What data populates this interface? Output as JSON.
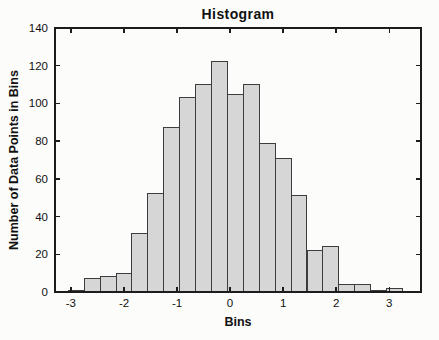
{
  "figure_title": "Histogram",
  "chart_data": {
    "type": "bar",
    "subtype": "histogram",
    "title": "Histogram",
    "xlabel": "Bins",
    "ylabel": "Number of Data Points in Bins",
    "bin_edges": [
      -3.05,
      -2.75,
      -2.45,
      -2.15,
      -1.85,
      -1.55,
      -1.25,
      -0.95,
      -0.65,
      -0.35,
      -0.05,
      0.25,
      0.55,
      0.85,
      1.15,
      1.45,
      1.75,
      2.05,
      2.35,
      2.65,
      2.95,
      3.25
    ],
    "values": [
      1,
      7,
      8,
      10,
      31,
      52,
      87,
      103,
      110,
      122,
      105,
      110,
      79,
      71,
      51,
      22,
      24,
      4,
      4,
      1,
      2
    ],
    "xlim": [
      -3.3,
      3.6
    ],
    "ylim": [
      0,
      140
    ],
    "x_ticks": [
      -3,
      -2,
      -1,
      0,
      1,
      2,
      3
    ],
    "y_ticks": [
      0,
      20,
      40,
      60,
      80,
      100,
      120,
      140
    ],
    "grid": false,
    "legend": null,
    "box": true,
    "tick_direction": "in"
  },
  "colors": {
    "background": "#fcfcfa",
    "bar_fill": "#d6d6d6",
    "bar_stroke": "#3d3d3d",
    "axis": "#1c1c1c",
    "text": "#111111"
  }
}
